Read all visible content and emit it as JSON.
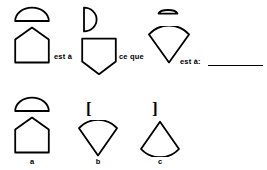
{
  "puzzle": {
    "type": "visual-analogy",
    "language": "fr",
    "connectors": {
      "est_a_1": "est à",
      "ce_que": "ce que",
      "est_a_2": "est à:"
    },
    "prompt_terms": [
      {
        "position": 1,
        "top_shape": "half-disc-flat-bottom",
        "bottom_shape": "house-pentagon-apex-up"
      },
      {
        "position": 2,
        "top_shape": "half-disc-flat-left",
        "bottom_shape": "shield-pentagon-apex-down"
      },
      {
        "position": 3,
        "top_shape": "flattened-half-disc-dash",
        "bottom_shape": "circular-sector-apex-down"
      }
    ],
    "answer_blank": {
      "present": true,
      "value": ""
    },
    "options": [
      {
        "label": "a",
        "top_shape": "half-disc-flat-bottom",
        "bottom_shape": "house-pentagon-apex-up"
      },
      {
        "label": "b",
        "top_shape": "bracket-open",
        "top_glyph": "[",
        "bottom_shape": "circular-sector-apex-down"
      },
      {
        "label": "c",
        "top_shape": "bracket-close",
        "top_glyph": "]",
        "bottom_shape": "circular-sector-apex-up"
      }
    ]
  },
  "style": {
    "ink": "#000000",
    "paper": "#ffffff",
    "stroke_width": 1.8
  }
}
